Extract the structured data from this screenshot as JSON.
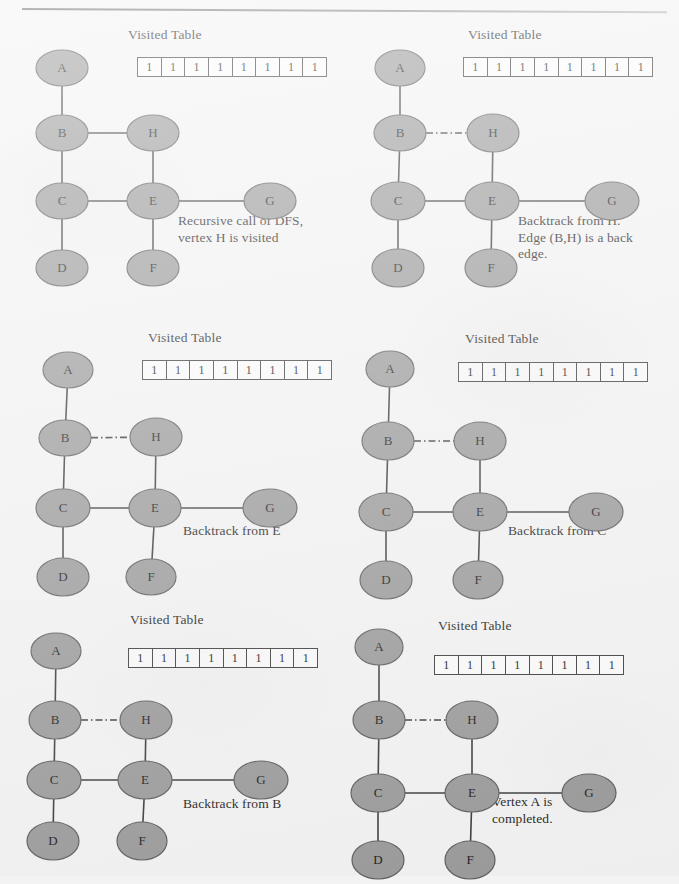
{
  "figure": {
    "type": "dfs-traversal-sequence",
    "vertex_labels": [
      "A",
      "B",
      "C",
      "D",
      "E",
      "F",
      "G",
      "H"
    ],
    "edges": [
      "A-B",
      "B-C",
      "B-H",
      "C-D",
      "C-E",
      "E-H",
      "E-F",
      "E-G"
    ],
    "back_edge": "B-H",
    "node_fill_color": "#9b9b9b",
    "node_stroke_color": "#5c5c5c",
    "edge_color": "#3a3a3a",
    "background_color": "#f3f3f3"
  },
  "panels": [
    {
      "id": "panel-1",
      "visited_table_title": "Visited Table",
      "visited_table_values": [
        "1",
        "1",
        "1",
        "1",
        "1",
        "1",
        "1",
        "1"
      ],
      "caption": "Recursive call of DFS,\nvertex H is visited",
      "back_edge_dashed": false,
      "nodes": [
        {
          "label": "A",
          "cx": 52,
          "cy": 48,
          "rx": 26,
          "ry": 18
        },
        {
          "label": "B",
          "cx": 52,
          "cy": 113,
          "rx": 26,
          "ry": 18
        },
        {
          "label": "C",
          "cx": 52,
          "cy": 181,
          "rx": 26,
          "ry": 18
        },
        {
          "label": "D",
          "cx": 52,
          "cy": 248,
          "rx": 26,
          "ry": 18
        },
        {
          "label": "H",
          "cx": 143,
          "cy": 113,
          "rx": 26,
          "ry": 18
        },
        {
          "label": "E",
          "cx": 143,
          "cy": 181,
          "rx": 26,
          "ry": 18
        },
        {
          "label": "F",
          "cx": 143,
          "cy": 248,
          "rx": 26,
          "ry": 18
        },
        {
          "label": "G",
          "cx": 260,
          "cy": 181,
          "rx": 26,
          "ry": 18
        }
      ]
    },
    {
      "id": "panel-2",
      "visited_table_title": "Visited Table",
      "visited_table_values": [
        "1",
        "1",
        "1",
        "1",
        "1",
        "1",
        "1",
        "1"
      ],
      "caption": "Backtrack from H.\nEdge (B,H) is a back\nedge.",
      "back_edge_dashed": true,
      "nodes": [
        {
          "label": "A",
          "cx": 50,
          "cy": 48,
          "rx": 25,
          "ry": 18
        },
        {
          "label": "B",
          "cx": 50,
          "cy": 113,
          "rx": 26,
          "ry": 18
        },
        {
          "label": "C",
          "cx": 48,
          "cy": 181,
          "rx": 27,
          "ry": 19
        },
        {
          "label": "D",
          "cx": 48,
          "cy": 248,
          "rx": 26,
          "ry": 19
        },
        {
          "label": "H",
          "cx": 143,
          "cy": 113,
          "rx": 26,
          "ry": 19
        },
        {
          "label": "E",
          "cx": 142,
          "cy": 181,
          "rx": 27,
          "ry": 19
        },
        {
          "label": "F",
          "cx": 141,
          "cy": 248,
          "rx": 26,
          "ry": 19
        },
        {
          "label": "G",
          "cx": 262,
          "cy": 181,
          "rx": 27,
          "ry": 19
        }
      ]
    },
    {
      "id": "panel-3",
      "visited_table_title": "Visited Table",
      "visited_table_values": [
        "1",
        "1",
        "1",
        "1",
        "1",
        "1",
        "1",
        "1"
      ],
      "caption": "Backtrack from E",
      "back_edge_dashed": true,
      "nodes": [
        {
          "label": "A",
          "cx": 58,
          "cy": 50,
          "rx": 25,
          "ry": 18
        },
        {
          "label": "B",
          "cx": 55,
          "cy": 118,
          "rx": 26,
          "ry": 18
        },
        {
          "label": "C",
          "cx": 53,
          "cy": 188,
          "rx": 27,
          "ry": 19
        },
        {
          "label": "D",
          "cx": 53,
          "cy": 257,
          "rx": 26,
          "ry": 19
        },
        {
          "label": "H",
          "cx": 146,
          "cy": 117,
          "rx": 26,
          "ry": 19
        },
        {
          "label": "E",
          "cx": 145,
          "cy": 188,
          "rx": 26,
          "ry": 19
        },
        {
          "label": "F",
          "cx": 141,
          "cy": 257,
          "rx": 25,
          "ry": 18
        },
        {
          "label": "G",
          "cx": 260,
          "cy": 188,
          "rx": 27,
          "ry": 19
        }
      ]
    },
    {
      "id": "panel-4",
      "visited_table_title": "Visited Table",
      "visited_table_values": [
        "1",
        "1",
        "1",
        "1",
        "1",
        "1",
        "1",
        "1"
      ],
      "caption": "Backtrack from C",
      "back_edge_dashed": true,
      "nodes": [
        {
          "label": "A",
          "cx": 40,
          "cy": 49,
          "rx": 24,
          "ry": 18
        },
        {
          "label": "B",
          "cx": 38,
          "cy": 121,
          "rx": 26,
          "ry": 19
        },
        {
          "label": "C",
          "cx": 36,
          "cy": 192,
          "rx": 27,
          "ry": 19
        },
        {
          "label": "D",
          "cx": 36,
          "cy": 260,
          "rx": 26,
          "ry": 19
        },
        {
          "label": "H",
          "cx": 130,
          "cy": 121,
          "rx": 26,
          "ry": 19
        },
        {
          "label": "E",
          "cx": 130,
          "cy": 192,
          "rx": 27,
          "ry": 19
        },
        {
          "label": "F",
          "cx": 128,
          "cy": 260,
          "rx": 25,
          "ry": 19
        },
        {
          "label": "G",
          "cx": 246,
          "cy": 192,
          "rx": 27,
          "ry": 19
        }
      ]
    },
    {
      "id": "panel-5",
      "visited_table_title": "Visited Table",
      "visited_table_values": [
        "1",
        "1",
        "1",
        "1",
        "1",
        "1",
        "1",
        "1"
      ],
      "caption": "Backtrack from B",
      "back_edge_dashed": true,
      "nodes": [
        {
          "label": "A",
          "cx": 46,
          "cy": 41,
          "rx": 25,
          "ry": 18
        },
        {
          "label": "B",
          "cx": 45,
          "cy": 110,
          "rx": 26,
          "ry": 19
        },
        {
          "label": "C",
          "cx": 44,
          "cy": 170,
          "rx": 27,
          "ry": 19
        },
        {
          "label": "D",
          "cx": 43,
          "cy": 231,
          "rx": 26,
          "ry": 19
        },
        {
          "label": "H",
          "cx": 136,
          "cy": 110,
          "rx": 26,
          "ry": 19
        },
        {
          "label": "E",
          "cx": 135,
          "cy": 170,
          "rx": 27,
          "ry": 19
        },
        {
          "label": "F",
          "cx": 132,
          "cy": 231,
          "rx": 25,
          "ry": 19
        },
        {
          "label": "G",
          "cx": 251,
          "cy": 170,
          "rx": 27,
          "ry": 19
        }
      ]
    },
    {
      "id": "panel-6",
      "visited_table_title": "Visited Table",
      "visited_table_values": [
        "1",
        "1",
        "1",
        "1",
        "1",
        "1",
        "1",
        "1"
      ],
      "caption": "Vertex A is\ncompleted.",
      "back_edge_dashed": true,
      "nodes": [
        {
          "label": "A",
          "cx": 29,
          "cy": 37,
          "rx": 24,
          "ry": 18
        },
        {
          "label": "B",
          "cx": 29,
          "cy": 110,
          "rx": 26,
          "ry": 19
        },
        {
          "label": "C",
          "cx": 28,
          "cy": 183,
          "rx": 27,
          "ry": 19
        },
        {
          "label": "D",
          "cx": 28,
          "cy": 250,
          "rx": 26,
          "ry": 19
        },
        {
          "label": "H",
          "cx": 122,
          "cy": 110,
          "rx": 26,
          "ry": 19
        },
        {
          "label": "E",
          "cx": 122,
          "cy": 183,
          "rx": 27,
          "ry": 19
        },
        {
          "label": "F",
          "cx": 120,
          "cy": 250,
          "rx": 25,
          "ry": 19
        },
        {
          "label": "G",
          "cx": 239,
          "cy": 183,
          "rx": 27,
          "ry": 19
        }
      ]
    }
  ],
  "panel_layout": [
    {
      "left": 10,
      "top": 20,
      "title_left": 128,
      "title_top": 27,
      "table_left": 137,
      "table_top": 57,
      "table_width": 190,
      "cap_left": 178,
      "cap_top": 213
    },
    {
      "left": 350,
      "top": 20,
      "title_left": 468,
      "title_top": 27,
      "table_left": 463,
      "table_top": 57,
      "table_width": 190,
      "cap_left": 518,
      "cap_top": 213
    },
    {
      "left": 10,
      "top": 320,
      "title_left": 148,
      "title_top": 330,
      "table_left": 142,
      "table_top": 360,
      "table_width": 190,
      "cap_left": 183,
      "cap_top": 523
    },
    {
      "left": 350,
      "top": 320,
      "title_left": 465,
      "title_top": 331,
      "table_left": 458,
      "table_top": 362,
      "table_width": 190,
      "cap_left": 508,
      "cap_top": 523
    },
    {
      "left": 10,
      "top": 610,
      "title_left": 130,
      "title_top": 612,
      "table_left": 128,
      "table_top": 648,
      "table_width": 190,
      "cap_left": 183,
      "cap_top": 796
    },
    {
      "left": 350,
      "top": 610,
      "title_left": 438,
      "title_top": 618,
      "table_left": 434,
      "table_top": 655,
      "table_width": 190,
      "cap_left": 492,
      "cap_top": 794
    }
  ]
}
